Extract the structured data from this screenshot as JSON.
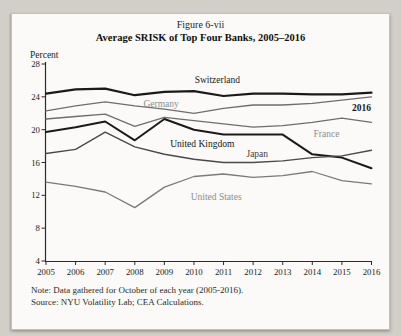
{
  "figure": {
    "number": "Figure 6-vii",
    "title": "Average SRISK of Top Four Banks, 2005–2016",
    "y_axis_unit": "Percent",
    "note": "Note: Data gathered for October of each year (2005-2016).",
    "source": "Source: NYU Volatility Lab; CEA Calculations."
  },
  "chart_data": {
    "type": "line",
    "title": "Average SRISK of Top Four Banks, 2005–2016",
    "xlabel": "",
    "ylabel": "Percent",
    "x": [
      2005,
      2006,
      2007,
      2008,
      2009,
      2010,
      2011,
      2012,
      2013,
      2014,
      2015,
      2016
    ],
    "ylim": [
      4,
      28
    ],
    "yticks": [
      4,
      8,
      12,
      16,
      20,
      24,
      28
    ],
    "grid": false,
    "legend_position": "inline-labels",
    "series": [
      {
        "name": "Switzerland",
        "color": "#1a1a1a",
        "width": 2.2,
        "values": [
          24.4,
          24.9,
          25.0,
          24.2,
          24.6,
          24.7,
          24.1,
          24.4,
          24.4,
          24.3,
          24.3,
          24.5
        ],
        "label": {
          "text": "Switzerland",
          "year": 2010.79,
          "value": 26.0,
          "color": "#1a1a1a"
        }
      },
      {
        "name": "Germany",
        "color": "#6e6e6e",
        "width": 1.3,
        "values": [
          22.3,
          22.9,
          23.4,
          22.9,
          22.5,
          22.0,
          22.6,
          23.0,
          23.0,
          23.2,
          23.6,
          24.0
        ],
        "label": {
          "text": "Germany",
          "year": 2008.89,
          "value": 23.1,
          "color": "#8d8d8d"
        }
      },
      {
        "name": "France",
        "color": "#6e6e6e",
        "width": 1.3,
        "values": [
          21.3,
          21.6,
          21.9,
          20.4,
          21.5,
          21.1,
          20.7,
          20.3,
          20.5,
          20.9,
          21.4,
          20.9
        ],
        "label": {
          "text": "France",
          "year": 2014.48,
          "value": 19.5,
          "color": "#8d8d8d"
        }
      },
      {
        "name": "United Kingdom",
        "color": "#1a1a1a",
        "width": 2.0,
        "values": [
          19.7,
          20.3,
          21.0,
          18.7,
          21.3,
          20.0,
          19.4,
          19.4,
          19.4,
          17.0,
          16.6,
          15.3
        ],
        "label": {
          "text": "United Kingdom",
          "year": 2010.28,
          "value": 18.3,
          "color": "#141414"
        }
      },
      {
        "name": "Japan",
        "color": "#4a4a4a",
        "width": 1.4,
        "values": [
          17.1,
          17.6,
          19.7,
          17.9,
          17.0,
          16.4,
          16.0,
          16.0,
          16.2,
          16.6,
          16.8,
          17.5
        ],
        "label": {
          "text": "Japan",
          "year": 2012.14,
          "value": 17.0,
          "color": "#3d3d3d"
        }
      },
      {
        "name": "United States",
        "color": "#7a7a7a",
        "width": 1.3,
        "values": [
          13.6,
          13.1,
          12.4,
          10.5,
          13.0,
          14.3,
          14.6,
          14.2,
          14.4,
          14.9,
          13.8,
          13.4
        ],
        "label": {
          "text": "United States",
          "year": 2010.75,
          "value": 11.8,
          "color": "#8d8d8d"
        }
      }
    ],
    "annotations": [
      {
        "text": "2016",
        "year": 2015.66,
        "value": 22.7,
        "color": "#1a1a1a",
        "bold": true
      }
    ]
  }
}
